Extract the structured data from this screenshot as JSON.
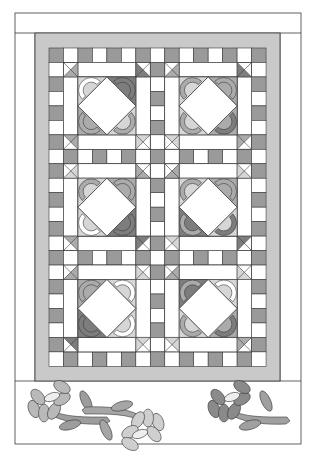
{
  "colors": {
    "outline": "#3a3a3a",
    "white": "#ffffff",
    "frame": "#c9c9c9",
    "light": "#d6d6d6",
    "medium": "#ababab",
    "dark": "#7d7d7d",
    "sash_grey": "#9a9a9a",
    "flower_center": "#eeeeee"
  },
  "layout": {
    "outer": {
      "x": 15,
      "y": 13,
      "w": 286,
      "h": 431
    },
    "top_band_bottom": 33,
    "left_margin_right": 35,
    "right_margin_left": 280,
    "quilt_bottom": 381,
    "grey_frame": {
      "x": 35,
      "y": 33,
      "w": 245,
      "h": 348
    },
    "grid": {
      "x": 49,
      "y": 48,
      "cols": 15,
      "rows": 22,
      "unit": 14.47
    }
  },
  "blocks": [
    {
      "name": "block-top-left",
      "col": 1,
      "row": 1,
      "corners": [
        "light",
        "dark",
        "light",
        "medium"
      ],
      "hst": [
        "medium",
        "dark",
        "light",
        "medium"
      ],
      "arcs": [
        "outline",
        "dark",
        "medium",
        "medium"
      ]
    },
    {
      "name": "block-top-right",
      "col": 8,
      "row": 1,
      "corners": [
        "light",
        "medium",
        "medium",
        "light"
      ],
      "hst": [
        "medium",
        "dark",
        "medium",
        "light"
      ],
      "arcs": [
        "medium",
        "medium",
        "dark",
        "medium"
      ]
    },
    {
      "name": "block-middle-left",
      "col": 1,
      "row": 8,
      "corners": [
        "light",
        "medium",
        "dark",
        "light"
      ],
      "hst": [
        "light",
        "medium",
        "dark",
        "medium"
      ],
      "arcs": [
        "medium",
        "medium",
        "dark",
        "outline"
      ]
    },
    {
      "name": "block-middle-right",
      "col": 8,
      "row": 8,
      "corners": [
        "light",
        "medium",
        "light",
        "dark"
      ],
      "hst": [
        "medium",
        "light",
        "dark",
        "light"
      ],
      "arcs": [
        "medium",
        "medium",
        "dark",
        "medium"
      ]
    },
    {
      "name": "block-bottom-left",
      "col": 1,
      "row": 15,
      "corners": [
        "medium",
        "light",
        "light",
        "dark"
      ],
      "hst": [
        "medium",
        "light",
        "light",
        "dark"
      ],
      "arcs": [
        "medium",
        "outline",
        "outline",
        "dark"
      ]
    },
    {
      "name": "block-bottom-right",
      "col": 8,
      "row": 15,
      "corners": [
        "dark",
        "light",
        "medium",
        "light"
      ],
      "hst": [
        "medium",
        "light",
        "medium",
        "light"
      ],
      "arcs": [
        "medium",
        "outline",
        "dark",
        "medium"
      ]
    }
  ],
  "flowers": [
    {
      "name": "flower-left",
      "cx": 52,
      "cy": 403,
      "rotate": 0,
      "petal": "#b9b9b9",
      "leaf": "#9d9d9d"
    },
    {
      "name": "flower-center",
      "cx": 140,
      "cy": 428,
      "rotate": 180,
      "petal": "#cfcfcf",
      "leaf": "#a6a6a6"
    },
    {
      "name": "flower-right",
      "cx": 232,
      "cy": 403,
      "rotate": 0,
      "petal": "#8a8a8a",
      "leaf": "#a0a0a0"
    }
  ]
}
